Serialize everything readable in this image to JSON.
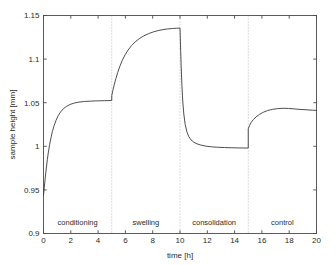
{
  "chart_data": {
    "type": "line",
    "title": "",
    "xlabel": "time [h]",
    "ylabel": "sample height [mm]",
    "xlim": [
      0,
      20
    ],
    "ylim": [
      0.9,
      1.15
    ],
    "xticks": [
      0,
      2,
      4,
      6,
      8,
      10,
      12,
      14,
      16,
      18,
      20
    ],
    "xtick_labels": [
      "0",
      "2",
      "4",
      "6",
      "8",
      "10",
      "12",
      "14",
      "16",
      "18",
      "20"
    ],
    "yticks": [
      0.9,
      0.95,
      1,
      1.05,
      1.1,
      1.15
    ],
    "ytick_labels": [
      "0.9",
      "0.95",
      "1",
      "1.05",
      "1.1",
      "1.15"
    ],
    "grid": false,
    "legend": null,
    "line_color": "#3a3a3a",
    "phase_boundaries": [
      5,
      10,
      15
    ],
    "phases": [
      {
        "label": "conditioning",
        "start": 0,
        "end": 5,
        "center": 2.5
      },
      {
        "label": "swelling",
        "start": 5,
        "end": 10,
        "center": 7.5
      },
      {
        "label": "consolidation",
        "start": 10,
        "end": 15,
        "center": 12.5
      },
      {
        "label": "control",
        "start": 15,
        "end": 20,
        "center": 17.5
      }
    ],
    "series": [
      {
        "name": "sample height",
        "points": [
          [
            0.0,
            0.944
          ],
          [
            0.06,
            0.953
          ],
          [
            0.12,
            0.9625
          ],
          [
            0.2,
            0.974
          ],
          [
            0.28,
            0.9845
          ],
          [
            0.36,
            0.9935
          ],
          [
            0.45,
            1.002
          ],
          [
            0.55,
            1.01
          ],
          [
            0.65,
            1.0168
          ],
          [
            0.78,
            1.0238
          ],
          [
            0.92,
            1.0298
          ],
          [
            1.08,
            1.0352
          ],
          [
            1.25,
            1.0394
          ],
          [
            1.45,
            1.043
          ],
          [
            1.68,
            1.0458
          ],
          [
            1.95,
            1.048
          ],
          [
            2.25,
            1.0496
          ],
          [
            2.6,
            1.0507
          ],
          [
            3.0,
            1.0514
          ],
          [
            3.45,
            1.0518
          ],
          [
            3.95,
            1.0521
          ],
          [
            4.45,
            1.0523
          ],
          [
            5.0,
            1.0525
          ],
          [
            5.0,
            1.058
          ],
          [
            5.08,
            1.064
          ],
          [
            5.18,
            1.0705
          ],
          [
            5.3,
            1.0775
          ],
          [
            5.44,
            1.0848
          ],
          [
            5.6,
            1.092
          ],
          [
            5.78,
            1.0988
          ],
          [
            5.98,
            1.105
          ],
          [
            6.2,
            1.1105
          ],
          [
            6.45,
            1.1155
          ],
          [
            6.72,
            1.1198
          ],
          [
            7.02,
            1.1235
          ],
          [
            7.35,
            1.1267
          ],
          [
            7.7,
            1.1292
          ],
          [
            8.05,
            1.1312
          ],
          [
            8.4,
            1.1327
          ],
          [
            8.75,
            1.1338
          ],
          [
            9.1,
            1.1346
          ],
          [
            9.45,
            1.1351
          ],
          [
            9.75,
            1.1354
          ],
          [
            10.0,
            1.1356
          ],
          [
            10.02,
            1.125
          ],
          [
            10.05,
            1.109
          ],
          [
            10.09,
            1.09
          ],
          [
            10.14,
            1.07
          ],
          [
            10.2,
            1.052
          ],
          [
            10.28,
            1.037
          ],
          [
            10.38,
            1.025
          ],
          [
            10.5,
            1.0168
          ],
          [
            10.64,
            1.0112
          ],
          [
            10.8,
            1.0075
          ],
          [
            11.0,
            1.0048
          ],
          [
            11.25,
            1.0028
          ],
          [
            11.55,
            1.0013
          ],
          [
            11.9,
            1.0002
          ],
          [
            12.3,
            0.9994
          ],
          [
            12.75,
            0.9989
          ],
          [
            13.25,
            0.9986
          ],
          [
            13.8,
            0.9983
          ],
          [
            14.4,
            0.9981
          ],
          [
            15.0,
            0.998
          ],
          [
            15.0,
            1.02
          ],
          [
            15.1,
            1.024
          ],
          [
            15.22,
            1.0275
          ],
          [
            15.38,
            1.0308
          ],
          [
            15.58,
            1.0338
          ],
          [
            15.82,
            1.0365
          ],
          [
            16.1,
            1.039
          ],
          [
            16.42,
            1.041
          ],
          [
            16.78,
            1.0424
          ],
          [
            17.15,
            1.0432
          ],
          [
            17.55,
            1.0436
          ],
          [
            17.95,
            1.0434
          ],
          [
            18.35,
            1.0429
          ],
          [
            18.8,
            1.0423
          ],
          [
            19.3,
            1.0418
          ],
          [
            19.7,
            1.0414
          ],
          [
            20.0,
            1.0412
          ]
        ]
      }
    ]
  }
}
